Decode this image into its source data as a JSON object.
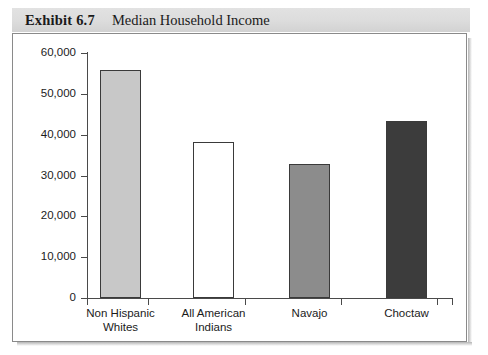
{
  "exhibit": {
    "label": "Exhibit 6.7",
    "title": "Median Household Income"
  },
  "chart_data": {
    "type": "bar",
    "title": "Median Household Income",
    "xlabel": "",
    "ylabel": "",
    "ylim": [
      0,
      60000
    ],
    "ytick_labels": [
      "60,000",
      "50,000",
      "40,000",
      "30,000",
      "20,000",
      "10,000",
      "0"
    ],
    "ytick_values": [
      60000,
      50000,
      40000,
      30000,
      20000,
      10000,
      0
    ],
    "grid": false,
    "legend": "none",
    "categories": [
      "Non Hispanic\nWhites",
      "All American\nIndians",
      "Navajo",
      "Choctaw"
    ],
    "category_labels": [
      "Non Hispanic Whites",
      "All American Indians",
      "Navajo",
      "Choctaw"
    ],
    "values": [
      55800,
      38300,
      32800,
      43400
    ],
    "bar_colors": [
      "#c8c8c8",
      "#ffffff",
      "#8c8c8c",
      "#3c3c3c"
    ],
    "bar_edge_color": "#3a3a3a"
  },
  "colors": {
    "header_band": "#dcdcdc",
    "frame_border": "#8a8a8a",
    "axis": "#4a4a4a",
    "text": "#1b1b1b"
  }
}
